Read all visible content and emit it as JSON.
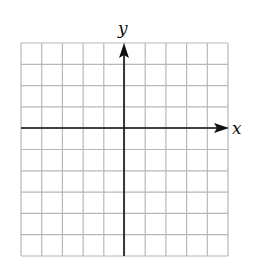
{
  "diagram": {
    "type": "coordinate-grid",
    "columns": 10,
    "rows": 10,
    "x_axis_label": "x",
    "y_axis_label": "y",
    "grid_color": "#b8b8b8",
    "axis_color": "#111111"
  }
}
